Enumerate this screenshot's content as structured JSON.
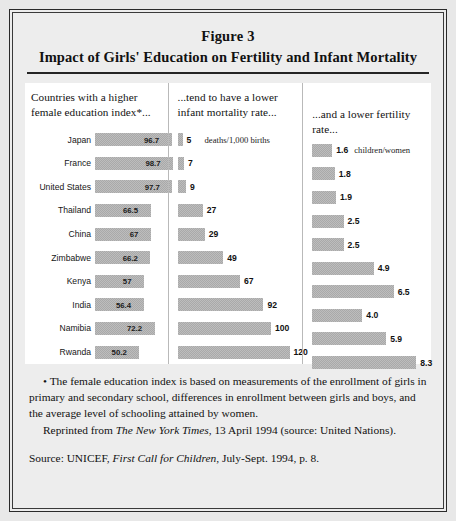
{
  "figure": {
    "label": "Figure 3",
    "title": "Impact of Girls' Education on Fertility and Infant Mortality"
  },
  "columns": {
    "col1_header_line1": "Countries with a higher",
    "col1_header_line2": "female education index*...",
    "col2_header_line1": "...tend to have a lower",
    "col2_header_line2": "infant mortality rate...",
    "col3_header": "...and a lower fertility rate..."
  },
  "units": {
    "infant_mortality": "deaths/1,000 births",
    "fertility": "children/women"
  },
  "notes": {
    "footnote": "• The female education index is based on measurements of the enrollment of girls in primary and secondary school, differences in enrollment between girls and boys, and the average level of schooling attained by women.",
    "reprint_prefix": "Reprinted from ",
    "reprint_italic": "The New York Times",
    "reprint_suffix": ", 13 April 1994 (source: United Nations).",
    "source_prefix": "Source: UNICEF, ",
    "source_italic": "First Call for Children",
    "source_suffix": ", July-Sept. 1994, p. 8."
  },
  "chart_data": {
    "type": "bar",
    "title": "Impact of Girls' Education on Fertility and Infant Mortality",
    "categories": [
      "Japan",
      "France",
      "United States",
      "Thailand",
      "China",
      "Zimbabwe",
      "Kenya",
      "India",
      "Namibia",
      "Rwanda"
    ],
    "series": [
      {
        "name": "Female education index",
        "unit": "",
        "values": [
          96.7,
          98.7,
          97.7,
          66.5,
          67,
          66.2,
          57,
          56.4,
          72.2,
          50.2
        ],
        "labels": [
          "96.7",
          "98.7",
          "97.7",
          "66.5",
          "67",
          "66.2",
          "57",
          "56.4",
          "72.2",
          "50.2"
        ],
        "max": 98.7
      },
      {
        "name": "Infant mortality rate",
        "unit": "deaths/1,000 births",
        "values": [
          5,
          7,
          9,
          27,
          29,
          49,
          67,
          92,
          100,
          120
        ],
        "labels": [
          "5",
          "7",
          "9",
          "27",
          "29",
          "49",
          "67",
          "92",
          "100",
          "120"
        ],
        "max": 120
      },
      {
        "name": "Fertility rate",
        "unit": "children/women",
        "values": [
          1.6,
          1.8,
          1.9,
          2.5,
          2.5,
          4.9,
          6.5,
          4.0,
          5.9,
          8.3
        ],
        "labels": [
          "1.6",
          "1.8",
          "1.9",
          "2.5",
          "2.5",
          "4.9",
          "6.5",
          "4.0",
          "5.9",
          "8.3"
        ],
        "max": 8.3
      }
    ],
    "grid": false,
    "legend": "none",
    "orientation": "horizontal"
  }
}
